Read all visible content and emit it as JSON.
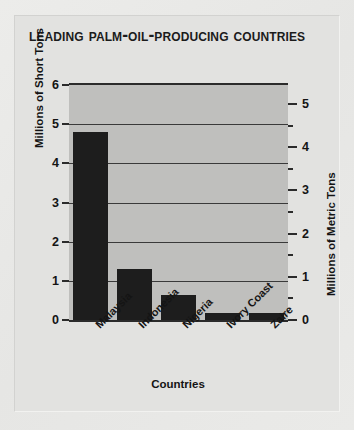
{
  "chart_data": {
    "type": "bar",
    "title": "Leading Palm-Oil-Producing Countries",
    "xlabel": "Countries",
    "ylabel": "Millions of Short Tons",
    "ylabel_secondary": "Millions of Metric Tons",
    "categories": [
      "Malaysia",
      "Indonesia",
      "Nigeria",
      "Ivory Coast",
      "Zaire"
    ],
    "values": [
      4.8,
      1.3,
      0.65,
      0.18,
      0.18
    ],
    "units": "millions of short tons",
    "ylim": [
      0,
      6
    ],
    "yticks": [
      0,
      1,
      2,
      3,
      4,
      5,
      6
    ],
    "ylim_secondary": [
      0,
      5.44
    ],
    "yticks_secondary": [
      0,
      1,
      2,
      3,
      4,
      5
    ],
    "grid": true,
    "legend": false,
    "bar_color": "#1d1d1d",
    "plot_bg": "#bfbfbd",
    "panel_bg": "#e2e2e0"
  },
  "chart": {
    "title": "Leading Palm-Oil-Producing Countries",
    "xaxis": {
      "label": "Countries"
    },
    "yaxis_left": {
      "label": "Millions of Short Tons",
      "ticks": [
        "6",
        "5",
        "4",
        "3",
        "2",
        "1",
        "0"
      ]
    },
    "yaxis_right": {
      "label": "Millions of Metric Tons",
      "ticks": [
        "5",
        "4",
        "3",
        "2",
        "1",
        "0"
      ]
    },
    "categories": [
      {
        "label": "Malaysia",
        "value": 4.8
      },
      {
        "label": "Indonesia",
        "value": 1.3
      },
      {
        "label": "Nigeria",
        "value": 0.65
      },
      {
        "label": "Ivory Coast",
        "value": 0.18
      },
      {
        "label": "Zaire",
        "value": 0.18
      }
    ]
  }
}
